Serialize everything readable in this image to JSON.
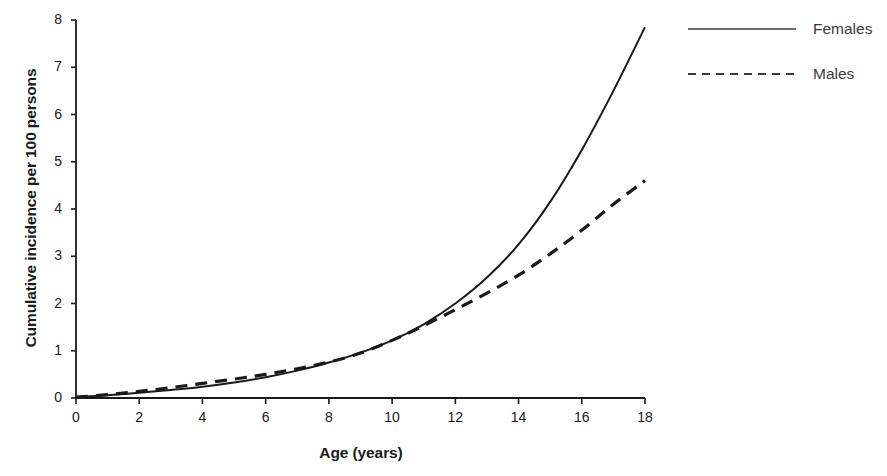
{
  "chart_data": {
    "type": "line",
    "title": "",
    "xlabel": "Age (years)",
    "ylabel": "Cumulative incidence per 100 persons",
    "xlim": [
      0,
      18
    ],
    "ylim": [
      0,
      8
    ],
    "grid": false,
    "legend_position": "right",
    "xticks": [
      "0",
      "2",
      "4",
      "6",
      "8",
      "10",
      "12",
      "14",
      "16",
      "18"
    ],
    "yticks": [
      "0",
      "1",
      "2",
      "3",
      "4",
      "5",
      "6",
      "7",
      "8"
    ],
    "x": [
      0,
      1,
      2,
      3,
      4,
      5,
      6,
      7,
      8,
      9,
      10,
      11,
      12,
      13,
      14,
      15,
      16,
      17,
      18
    ],
    "series": [
      {
        "name": "Females",
        "style": "solid",
        "color": "#1a1a1a",
        "values": [
          0.02,
          0.06,
          0.11,
          0.17,
          0.24,
          0.33,
          0.44,
          0.58,
          0.75,
          0.96,
          1.22,
          1.56,
          2.0,
          2.55,
          3.25,
          4.15,
          5.25,
          6.5,
          7.85
        ]
      },
      {
        "name": "Males",
        "style": "dashed",
        "color": "#1a1a1a",
        "values": [
          0.02,
          0.07,
          0.14,
          0.22,
          0.31,
          0.4,
          0.5,
          0.62,
          0.76,
          0.95,
          1.22,
          1.53,
          1.87,
          2.22,
          2.6,
          3.05,
          3.55,
          4.1,
          4.6
        ]
      }
    ],
    "annotations": {
      "crossover_age": 14,
      "crossover_value": 2.6
    }
  },
  "legend": {
    "items": [
      {
        "label": "Females",
        "style": "solid"
      },
      {
        "label": "Males",
        "style": "dashed"
      }
    ]
  }
}
